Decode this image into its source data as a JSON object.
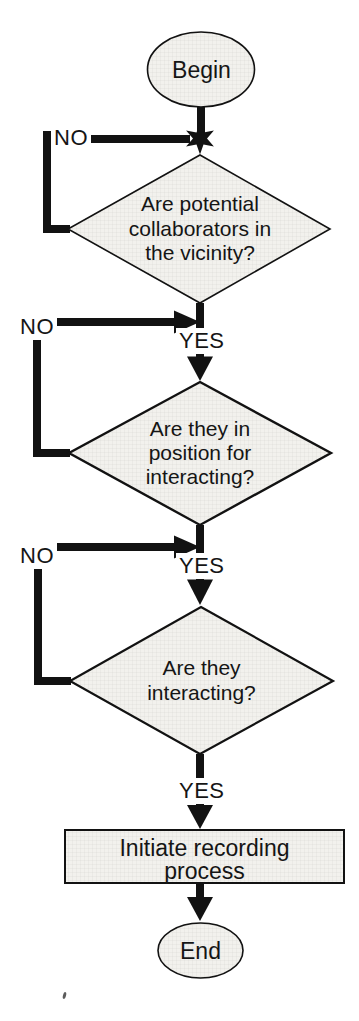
{
  "colors": {
    "shape_fill": "#f2f1ed",
    "grid_tint": "#0000000D",
    "line": "#121212",
    "text": "#151515",
    "background": "#ffffff"
  },
  "flowchart": {
    "start": {
      "label": "Begin"
    },
    "decisions": [
      {
        "text": "Are potential collaborators in the vicinity?",
        "lines": [
          "Are potential",
          "collaborators in",
          "the vicinity?"
        ],
        "no_label": "NO",
        "yes_label": "YES"
      },
      {
        "text": "Are they in position for interacting?",
        "lines": [
          "Are they in",
          "position for",
          "interacting?"
        ],
        "no_label": "NO",
        "yes_label": "YES"
      },
      {
        "text": "Are they interacting?",
        "lines": [
          "Are they",
          "interacting?"
        ],
        "no_label": "NO",
        "yes_label": "YES"
      }
    ],
    "process": {
      "text": "Initiate recording process",
      "lines": [
        "Initiate recording",
        "process"
      ]
    },
    "end": {
      "label": "End"
    }
  }
}
